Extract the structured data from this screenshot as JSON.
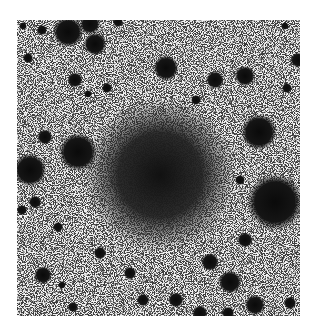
{
  "image": {
    "description": "Inverted (negative) astronomical photograph of a star field with a large diffuse dark central object",
    "colors": {
      "background": "#ffffff",
      "sky": "#d8d8d8",
      "object": "#111111"
    },
    "central_object": {
      "cx": 160,
      "cy": 175,
      "r": 48
    },
    "stars": [
      {
        "x": 23,
        "y": 26,
        "r": 3
      },
      {
        "x": 42,
        "y": 30,
        "r": 4
      },
      {
        "x": 68,
        "y": 32,
        "r": 12
      },
      {
        "x": 90,
        "y": 24,
        "r": 8
      },
      {
        "x": 95,
        "y": 44,
        "r": 9
      },
      {
        "x": 118,
        "y": 22,
        "r": 4
      },
      {
        "x": 28,
        "y": 58,
        "r": 4
      },
      {
        "x": 75,
        "y": 80,
        "r": 6
      },
      {
        "x": 107,
        "y": 88,
        "r": 4
      },
      {
        "x": 166,
        "y": 68,
        "r": 10
      },
      {
        "x": 215,
        "y": 80,
        "r": 7
      },
      {
        "x": 245,
        "y": 76,
        "r": 8
      },
      {
        "x": 287,
        "y": 88,
        "r": 4
      },
      {
        "x": 298,
        "y": 60,
        "r": 6
      },
      {
        "x": 285,
        "y": 26,
        "r": 3
      },
      {
        "x": 88,
        "y": 94,
        "r": 3
      },
      {
        "x": 45,
        "y": 137,
        "r": 6
      },
      {
        "x": 78,
        "y": 152,
        "r": 15
      },
      {
        "x": 30,
        "y": 170,
        "r": 13
      },
      {
        "x": 259,
        "y": 132,
        "r": 14
      },
      {
        "x": 275,
        "y": 202,
        "r": 22
      },
      {
        "x": 240,
        "y": 180,
        "r": 4
      },
      {
        "x": 35,
        "y": 202,
        "r": 5
      },
      {
        "x": 58,
        "y": 227,
        "r": 4
      },
      {
        "x": 100,
        "y": 253,
        "r": 5
      },
      {
        "x": 43,
        "y": 275,
        "r": 7
      },
      {
        "x": 62,
        "y": 285,
        "r": 3
      },
      {
        "x": 130,
        "y": 273,
        "r": 5
      },
      {
        "x": 143,
        "y": 300,
        "r": 5
      },
      {
        "x": 176,
        "y": 300,
        "r": 6
      },
      {
        "x": 210,
        "y": 262,
        "r": 7
      },
      {
        "x": 230,
        "y": 282,
        "r": 9
      },
      {
        "x": 255,
        "y": 305,
        "r": 8
      },
      {
        "x": 290,
        "y": 303,
        "r": 5
      },
      {
        "x": 73,
        "y": 307,
        "r": 4
      },
      {
        "x": 245,
        "y": 240,
        "r": 6
      },
      {
        "x": 200,
        "y": 313,
        "r": 6
      },
      {
        "x": 228,
        "y": 313,
        "r": 5
      },
      {
        "x": 22,
        "y": 210,
        "r": 4
      },
      {
        "x": 196,
        "y": 100,
        "r": 4
      }
    ]
  }
}
